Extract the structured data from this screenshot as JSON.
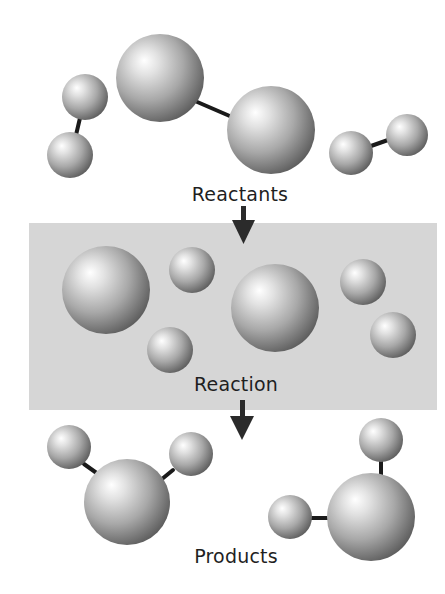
{
  "diagram": {
    "type": "molecular-reaction-schematic",
    "colors": {
      "background": "#ffffff",
      "panel": "#d6d6d6",
      "sphere_light": "#ffffff",
      "sphere_mid": "#a9a9a9",
      "sphere_dark": "#5e5e5e",
      "bond": "#1a1a1a",
      "arrow": "#2b2b2b",
      "text": "#1f1f1f"
    },
    "stages": [
      {
        "id": "reactants",
        "label": "Reactants"
      },
      {
        "id": "reaction",
        "label": "Reaction"
      },
      {
        "id": "products",
        "label": "Products"
      }
    ],
    "labels": {
      "reactants": "Reactants",
      "reaction": "Reaction",
      "products": "Products"
    },
    "reactants": {
      "molecules": [
        {
          "name": "small-diatomic-left",
          "atoms": [
            {
              "cx": 85,
              "cy": 97,
              "r": 23
            },
            {
              "cx": 70,
              "cy": 155,
              "r": 23
            }
          ]
        },
        {
          "name": "large-diatomic",
          "atoms": [
            {
              "cx": 160,
              "cy": 78,
              "r": 44
            },
            {
              "cx": 271,
              "cy": 130,
              "r": 44
            }
          ]
        },
        {
          "name": "small-diatomic-right",
          "atoms": [
            {
              "cx": 351,
              "cy": 153,
              "r": 22
            },
            {
              "cx": 407,
              "cy": 135,
              "r": 21
            }
          ]
        }
      ]
    },
    "reaction": {
      "free_atoms": [
        {
          "cx": 106,
          "cy": 290,
          "r": 44
        },
        {
          "cx": 192,
          "cy": 270,
          "r": 23
        },
        {
          "cx": 170,
          "cy": 350,
          "r": 23
        },
        {
          "cx": 275,
          "cy": 308,
          "r": 44
        },
        {
          "cx": 363,
          "cy": 282,
          "r": 23
        },
        {
          "cx": 393,
          "cy": 335,
          "r": 23
        }
      ]
    },
    "products": {
      "molecules": [
        {
          "name": "triatomic-left",
          "atoms": [
            {
              "cx": 127,
              "cy": 502,
              "r": 43
            },
            {
              "cx": 69,
              "cy": 447,
              "r": 22
            },
            {
              "cx": 191,
              "cy": 454,
              "r": 22
            }
          ]
        },
        {
          "name": "triatomic-right",
          "atoms": [
            {
              "cx": 371,
              "cy": 517,
              "r": 44
            },
            {
              "cx": 381,
              "cy": 440,
              "r": 22
            },
            {
              "cx": 290,
              "cy": 517,
              "r": 22
            }
          ]
        }
      ]
    }
  }
}
